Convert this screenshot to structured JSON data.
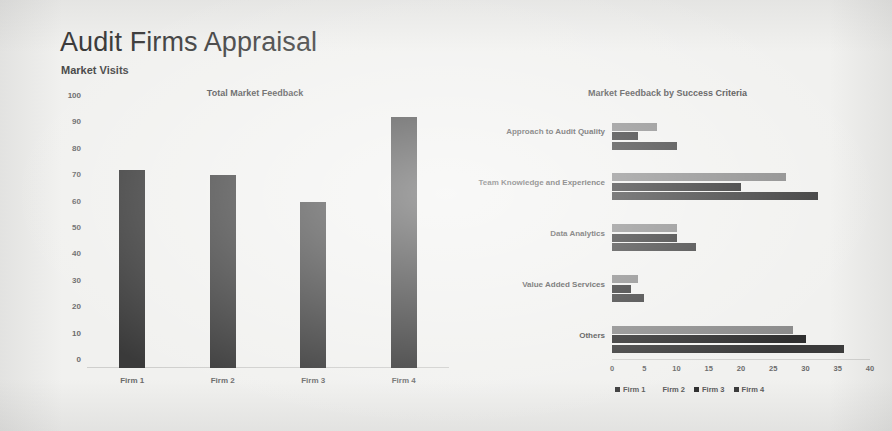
{
  "header": {
    "title": "Audit Firms Appraisal",
    "subtitle": "Market Visits"
  },
  "colors": {
    "firm1": "#3a3a3a",
    "firm2": "#8a8a8a",
    "firm3": "#2f2f2f",
    "firm4": "#3a3a3a",
    "background": "#f1f1ef",
    "title_text": "#3b3b3b",
    "axis_text": "#6b6b6b"
  },
  "chart_data": [
    {
      "type": "bar",
      "title": "Total Market Feedback",
      "xlabel": "",
      "ylabel": "",
      "categories": [
        "Firm 1",
        "Firm 2",
        "Firm 3",
        "Firm 4"
      ],
      "values": [
        75,
        73,
        63,
        95
      ],
      "ylim": [
        0,
        100
      ],
      "yticks": [
        0,
        10,
        20,
        30,
        40,
        50,
        60,
        70,
        80,
        90,
        100
      ],
      "grid": false,
      "legend": "none"
    },
    {
      "type": "bar",
      "orientation": "horizontal",
      "title": "Market Feedback by Success Criteria",
      "xlabel": "",
      "ylabel": "",
      "categories": [
        "Approach to Audit Quality",
        "Team Knowledge and Experience",
        "Data Analytics",
        "Value Added Services",
        "Others"
      ],
      "series": [
        {
          "name": "Firm 1",
          "values": [
            0,
            0,
            0,
            0,
            0
          ]
        },
        {
          "name": "Firm 2",
          "values": [
            7,
            27,
            10,
            4,
            28
          ]
        },
        {
          "name": "Firm 3",
          "values": [
            4,
            20,
            10,
            3,
            30
          ]
        },
        {
          "name": "Firm 4",
          "values": [
            10,
            32,
            13,
            5,
            36
          ]
        }
      ],
      "xlim": [
        0,
        40
      ],
      "xticks": [
        0,
        5,
        10,
        15,
        20,
        25,
        30,
        35,
        40
      ],
      "grid": false,
      "legend": "bottom"
    }
  ]
}
